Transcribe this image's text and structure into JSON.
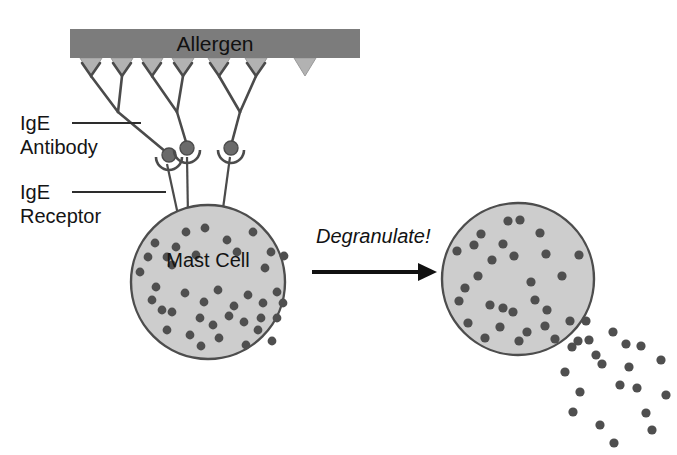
{
  "figure": {
    "background_color": "#ffffff"
  },
  "labels": {
    "allergen": "Allergen",
    "ige_antibody_line1": "IgE",
    "ige_antibody_line2": "Antibody",
    "ige_receptor_line1": "IgE",
    "ige_receptor_line2": "Receptor",
    "mast_cell": "Mast Cell",
    "degranulate": "Degranulate!"
  },
  "colors": {
    "allergen_bar": "#7c7c7c",
    "allergen_wedge": "#b0b0b0",
    "cell_fill": "#cdcdcd",
    "cell_stroke": "#4d4d4d",
    "granule": "#4f4f4f",
    "line": "#4b4b4b",
    "text": "#141414",
    "arrow": "#111111"
  },
  "geometry": {
    "canvas": {
      "width": 677,
      "height": 455
    },
    "allergen_bar": {
      "x": 70,
      "y": 29,
      "width": 290,
      "height": 29
    },
    "allergen_wedges_x": [
      91,
      122,
      152,
      183,
      219,
      256,
      305
    ],
    "antibodies": [
      {
        "arm_left_x": 91,
        "arm_right_x": 122,
        "arm_top_y": 58,
        "fork_y": 88,
        "stem_x": 169,
        "stem_y": 155
      },
      {
        "arm_left_x": 152,
        "arm_right_x": 183,
        "arm_top_y": 58,
        "fork_y": 88,
        "stem_x": 187,
        "stem_y": 148
      },
      {
        "arm_left_x": 219,
        "arm_right_x": 256,
        "arm_top_y": 58,
        "fork_y": 88,
        "stem_x": 231,
        "stem_y": 148
      }
    ],
    "receptors": [
      {
        "cx": 169,
        "cy": 157,
        "r": 7,
        "stem_end_x": 179,
        "stem_end_y": 222
      },
      {
        "cx": 187,
        "cy": 148,
        "r": 7,
        "stem_end_x": 187,
        "stem_end_y": 215
      },
      {
        "cx": 231,
        "cy": 148,
        "r": 7,
        "stem_end_x": 222,
        "stem_end_y": 214
      }
    ],
    "mast_cell_left": {
      "cx": 208,
      "cy": 282,
      "r": 77
    },
    "mast_cell_right": {
      "cx": 518,
      "cy": 279,
      "r": 76
    },
    "arrow": {
      "x1": 312,
      "y1": 272,
      "x2": 434,
      "y2": 272
    },
    "leader_ige_antibody": {
      "x1": 72,
      "y1": 123,
      "x2": 140,
      "y2": 123
    },
    "leader_ige_receptor": {
      "x1": 72,
      "y1": 192,
      "x2": 165,
      "y2": 192
    }
  },
  "granules_left_cell": [
    [
      186,
      232
    ],
    [
      205,
      228
    ],
    [
      155,
      243
    ],
    [
      176,
      247
    ],
    [
      227,
      240
    ],
    [
      253,
      232
    ],
    [
      271,
      252
    ],
    [
      148,
      257
    ],
    [
      167,
      257
    ],
    [
      196,
      255
    ],
    [
      237,
      252
    ],
    [
      284,
      256
    ],
    [
      265,
      268
    ],
    [
      172,
      265
    ],
    [
      140,
      272
    ],
    [
      156,
      287
    ],
    [
      185,
      293
    ],
    [
      218,
      290
    ],
    [
      204,
      302
    ],
    [
      248,
      295
    ],
    [
      277,
      292
    ],
    [
      162,
      310
    ],
    [
      172,
      312
    ],
    [
      200,
      318
    ],
    [
      229,
      316
    ],
    [
      244,
      322
    ],
    [
      213,
      325
    ],
    [
      261,
      318
    ],
    [
      258,
      330
    ],
    [
      277,
      318
    ],
    [
      283,
      303
    ],
    [
      190,
      335
    ],
    [
      219,
      338
    ],
    [
      246,
      345
    ],
    [
      272,
      341
    ],
    [
      201,
      346
    ],
    [
      167,
      330
    ],
    [
      234,
      306
    ],
    [
      152,
      300
    ],
    [
      263,
      303
    ]
  ],
  "granules_right_cell": [
    [
      508,
      221
    ],
    [
      520,
      220
    ],
    [
      481,
      234
    ],
    [
      540,
      233
    ],
    [
      474,
      245
    ],
    [
      503,
      244
    ],
    [
      514,
      256
    ],
    [
      546,
      254
    ],
    [
      579,
      255
    ],
    [
      457,
      251
    ],
    [
      478,
      276
    ],
    [
      531,
      282
    ],
    [
      562,
      276
    ],
    [
      459,
      301
    ],
    [
      490,
      305
    ],
    [
      503,
      308
    ],
    [
      513,
      312
    ],
    [
      547,
      310
    ],
    [
      468,
      323
    ],
    [
      500,
      327
    ],
    [
      545,
      326
    ],
    [
      570,
      321
    ],
    [
      527,
      332
    ],
    [
      485,
      338
    ],
    [
      519,
      341
    ],
    [
      555,
      339
    ],
    [
      578,
      341
    ],
    [
      535,
      300
    ],
    [
      492,
      260
    ],
    [
      465,
      288
    ]
  ],
  "granules_escaped": [
    [
      586,
      321
    ],
    [
      613,
      332
    ],
    [
      626,
      344
    ],
    [
      596,
      355
    ],
    [
      572,
      347
    ],
    [
      641,
      346
    ],
    [
      602,
      364
    ],
    [
      565,
      372
    ],
    [
      629,
      367
    ],
    [
      661,
      360
    ],
    [
      580,
      392
    ],
    [
      620,
      385
    ],
    [
      573,
      412
    ],
    [
      600,
      425
    ],
    [
      646,
      413
    ],
    [
      666,
      395
    ],
    [
      652,
      430
    ],
    [
      614,
      443
    ],
    [
      589,
      340
    ],
    [
      637,
      388
    ]
  ]
}
